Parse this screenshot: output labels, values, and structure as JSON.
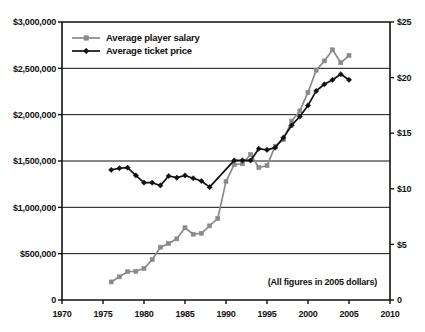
{
  "chart_data": {
    "type": "line",
    "title": "",
    "subtitle": "",
    "xlabel": "",
    "ylabel": "",
    "y2label": "",
    "annotation": "(All figures in 2005 dollars)",
    "grid": true,
    "legend_position": "top-left",
    "xlim": [
      1970,
      2010
    ],
    "xticks": [
      1970,
      1975,
      1980,
      1985,
      1990,
      1995,
      2000,
      2005,
      2010
    ],
    "xtick_labels": [
      "1970",
      "1975",
      "1980",
      "1985",
      "1990",
      "1995",
      "2000",
      "2005",
      "2010"
    ],
    "ylim": [
      0,
      3000000
    ],
    "yticks": [
      0,
      500000,
      1000000,
      1500000,
      2000000,
      2500000,
      3000000
    ],
    "ytick_labels": [
      "0",
      "$500,000",
      "$1,000,000",
      "$1,500,000",
      "$2,000,000",
      "$2,500,000",
      "$3,000,000"
    ],
    "y2lim": [
      0,
      25
    ],
    "y2ticks": [
      0,
      5,
      10,
      15,
      20,
      25
    ],
    "y2tick_labels": [
      "0",
      "$5",
      "$10",
      "$15",
      "$20",
      "$25"
    ],
    "series": [
      {
        "name": "Average player salary",
        "axis": "left",
        "color": "#8a8a8a",
        "marker": "square",
        "x": [
          1976,
          1977,
          1978,
          1979,
          1980,
          1981,
          1982,
          1983,
          1984,
          1985,
          1986,
          1987,
          1988,
          1989,
          1990,
          1991,
          1992,
          1993,
          1994,
          1995,
          1996,
          1997,
          1998,
          1999,
          2000,
          2001,
          2002,
          2003,
          2004,
          2005
        ],
        "values": [
          195000,
          250000,
          305000,
          310000,
          340000,
          435000,
          570000,
          610000,
          660000,
          780000,
          710000,
          720000,
          800000,
          880000,
          1280000,
          1460000,
          1470000,
          1570000,
          1430000,
          1450000,
          1660000,
          1730000,
          1930000,
          2040000,
          2240000,
          2480000,
          2580000,
          2700000,
          2560000,
          2640000
        ]
      },
      {
        "name": "Average ticket price",
        "axis": "right",
        "color": "#111111",
        "marker": "diamond",
        "x": [
          1976,
          1977,
          1978,
          1979,
          1980,
          1981,
          1982,
          1983,
          1984,
          1985,
          1986,
          1987,
          1988,
          1991,
          1992,
          1993,
          1994,
          1995,
          1996,
          1997,
          1998,
          1999,
          2000,
          2001,
          2002,
          2003,
          2004,
          2005
        ],
        "values": [
          11.7,
          11.85,
          11.9,
          11.2,
          10.55,
          10.55,
          10.3,
          11.15,
          11.0,
          11.2,
          10.95,
          10.7,
          10.15,
          12.55,
          12.55,
          12.55,
          13.6,
          13.5,
          13.7,
          14.6,
          15.7,
          16.5,
          17.5,
          18.8,
          19.4,
          19.8,
          20.3,
          19.8
        ]
      }
    ]
  },
  "legend": {
    "items": [
      {
        "label": "Average player salary",
        "color": "#8a8a8a",
        "marker": "square"
      },
      {
        "label": "Average ticket price",
        "color": "#111111",
        "marker": "diamond"
      }
    ]
  },
  "axes": {
    "left_tick_labels": [
      "$3,000,000",
      "$2,500,000",
      "$2,000,000",
      "$1,500,000",
      "$1,000,000",
      "$500,000",
      "0"
    ],
    "right_tick_labels": [
      "$25",
      "$20",
      "$15",
      "$10",
      "$5",
      "0"
    ],
    "bottom_tick_labels": [
      "1970",
      "1975",
      "1980",
      "1985",
      "1990",
      "1995",
      "2000",
      "2005",
      "2010"
    ]
  },
  "note": {
    "text": "(All figures in 2005 dollars)"
  },
  "colors": {
    "salary_series": "#8a8a8a",
    "ticket_series": "#111111",
    "axis": "#111111",
    "grid": "#111111",
    "background": "#ffffff"
  }
}
